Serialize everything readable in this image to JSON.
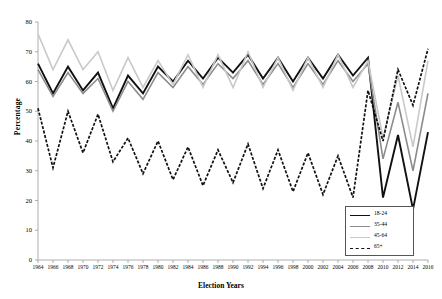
{
  "chart_data": {
    "type": "line",
    "title": "",
    "xlabel": "Election Years",
    "ylabel": "Percentage",
    "ylim": [
      0,
      80
    ],
    "ytick_step": 10,
    "yticks": [
      0,
      10,
      20,
      30,
      40,
      50,
      60,
      70,
      80
    ],
    "grid": false,
    "legend_position": "bottom-right",
    "categories": [
      1964,
      1966,
      1968,
      1970,
      1972,
      1974,
      1976,
      1978,
      1980,
      1982,
      1984,
      1986,
      1988,
      1990,
      1992,
      1994,
      1996,
      1998,
      2000,
      2002,
      2004,
      2006,
      2008,
      2010,
      2012,
      2014,
      2016
    ],
    "series": [
      {
        "name": "18-24",
        "color": "#111111",
        "style": "solid",
        "width": 1.9,
        "values": [
          66,
          56,
          65,
          57,
          63,
          51,
          62,
          56,
          65,
          60,
          67,
          61,
          68,
          63,
          69,
          61,
          68,
          60,
          68,
          61,
          69,
          62,
          68,
          21,
          42,
          17,
          43
        ]
      },
      {
        "name": "35-44",
        "color": "#8c8c8c",
        "style": "solid",
        "width": 1.6,
        "values": [
          64,
          55,
          63,
          56,
          61,
          50,
          60,
          54,
          63,
          58,
          65,
          59,
          66,
          61,
          67,
          59,
          66,
          58,
          66,
          59,
          67,
          60,
          66,
          34,
          53,
          30,
          56
        ]
      },
      {
        "name": "45-64",
        "color": "#c9c9c9",
        "style": "solid",
        "width": 1.6,
        "values": [
          76,
          64,
          74,
          64,
          70,
          57,
          68,
          58,
          67,
          59,
          69,
          58,
          69,
          58,
          70,
          58,
          68,
          57,
          68,
          58,
          69,
          58,
          67,
          41,
          62,
          38,
          67
        ]
      },
      {
        "name": "65+",
        "color": "#111111",
        "style": "dashed",
        "width": 1.7,
        "values": [
          51,
          31,
          50,
          36,
          49,
          33,
          41,
          29,
          40,
          27,
          38,
          25,
          37,
          26,
          39,
          24,
          37,
          23,
          36,
          22,
          35,
          21,
          57,
          40,
          64,
          52,
          71
        ]
      }
    ]
  },
  "legend": {
    "items": [
      {
        "label": "18-24"
      },
      {
        "label": "35-44"
      },
      {
        "label": "45-64"
      },
      {
        "label": "65+"
      }
    ]
  }
}
